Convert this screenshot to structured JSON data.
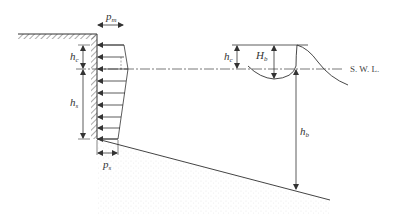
{
  "diagram": {
    "title": "",
    "colors": {
      "line": "#333333",
      "hatch": "#555555",
      "seabed_stipple": "#aaaaaa",
      "background": "#ffffff"
    },
    "labels": {
      "p_m": {
        "main": "p",
        "sub": "m"
      },
      "p_s": {
        "main": "p",
        "sub": "s"
      },
      "h_c_wall": {
        "main": "h",
        "sub": "c"
      },
      "h_s": {
        "main": "h",
        "sub": "s"
      },
      "h_c_wave": {
        "main": "h",
        "sub": "c"
      },
      "H_b": {
        "main": "H",
        "sub": "b"
      },
      "h_b": {
        "main": "h",
        "sub": "b"
      },
      "swl": "S. W. L."
    },
    "elements": [
      "ground-surface-hatched",
      "vertical-wall-hatched",
      "pressure-distribution-arrows",
      "still-water-level-line",
      "breaking-wave-profile",
      "sloping-seabed",
      "dimension-arrows"
    ]
  }
}
